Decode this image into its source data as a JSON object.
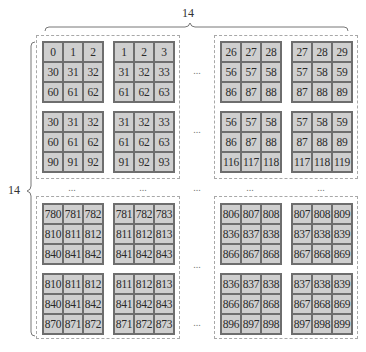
{
  "diagram": {
    "top_brace_label": "14",
    "left_brace_label": "14",
    "ellipsis": "...",
    "colors": {
      "cell_fill": "#cfcfcf",
      "cell_border": "#6e6e6e",
      "dashed_border": "#a8a8a8",
      "brace": "#777777"
    },
    "quadrants": [
      {
        "name": "top-left",
        "patches": [
          {
            "cells": [
              "0",
              "1",
              "2",
              "30",
              "31",
              "32",
              "60",
              "61",
              "62"
            ]
          },
          {
            "cells": [
              "1",
              "2",
              "3",
              "31",
              "32",
              "33",
              "61",
              "62",
              "63"
            ]
          },
          {
            "cells": [
              "30",
              "31",
              "32",
              "60",
              "61",
              "62",
              "90",
              "91",
              "92"
            ]
          },
          {
            "cells": [
              "31",
              "32",
              "33",
              "61",
              "62",
              "63",
              "91",
              "92",
              "93"
            ]
          }
        ]
      },
      {
        "name": "top-right",
        "patches": [
          {
            "cells": [
              "26",
              "27",
              "28",
              "56",
              "57",
              "58",
              "86",
              "87",
              "88"
            ]
          },
          {
            "cells": [
              "27",
              "28",
              "29",
              "57",
              "58",
              "59",
              "87",
              "88",
              "89"
            ]
          },
          {
            "cells": [
              "56",
              "57",
              "58",
              "86",
              "87",
              "88",
              "116",
              "117",
              "118"
            ]
          },
          {
            "cells": [
              "57",
              "58",
              "59",
              "87",
              "88",
              "89",
              "117",
              "118",
              "119"
            ]
          }
        ]
      },
      {
        "name": "bottom-left",
        "patches": [
          {
            "cells": [
              "780",
              "781",
              "782",
              "810",
              "811",
              "812",
              "840",
              "841",
              "842"
            ]
          },
          {
            "cells": [
              "781",
              "782",
              "783",
              "811",
              "812",
              "813",
              "841",
              "842",
              "843"
            ]
          },
          {
            "cells": [
              "810",
              "811",
              "812",
              "840",
              "841",
              "842",
              "870",
              "871",
              "872"
            ]
          },
          {
            "cells": [
              "811",
              "812",
              "813",
              "841",
              "842",
              "843",
              "871",
              "872",
              "873"
            ]
          }
        ]
      },
      {
        "name": "bottom-right",
        "patches": [
          {
            "cells": [
              "806",
              "807",
              "808",
              "836",
              "837",
              "838",
              "866",
              "867",
              "868"
            ]
          },
          {
            "cells": [
              "807",
              "808",
              "809",
              "837",
              "838",
              "839",
              "867",
              "868",
              "869"
            ]
          },
          {
            "cells": [
              "836",
              "837",
              "838",
              "866",
              "867",
              "868",
              "896",
              "897",
              "898"
            ]
          },
          {
            "cells": [
              "837",
              "838",
              "839",
              "867",
              "868",
              "869",
              "897",
              "898",
              "899"
            ]
          }
        ]
      }
    ]
  }
}
